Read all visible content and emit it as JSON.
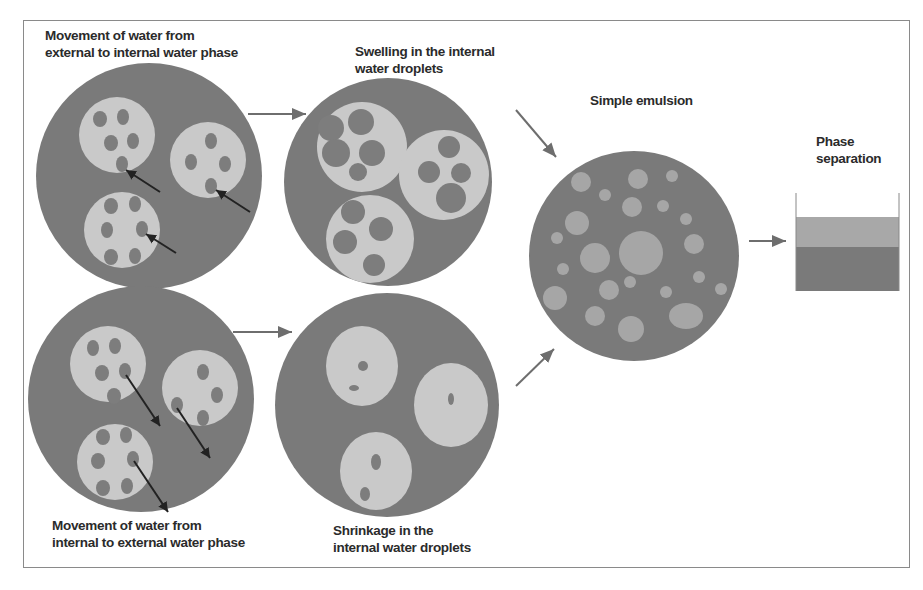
{
  "labels": {
    "top_left": [
      "Movement of water from",
      "external to internal water phase"
    ],
    "top_middle": [
      "Swelling in the internal",
      "water droplets"
    ],
    "bottom_left": [
      "Movement of water from",
      "internal to external water phase"
    ],
    "bottom_middle": [
      "Shrinkage in the",
      "internal water droplets"
    ],
    "simple_emulsion": "Simple emulsion",
    "phase_separation": [
      "Phase",
      "separation"
    ]
  },
  "colors": {
    "oil_phase": "#7a7a7a",
    "water_globule": "#c9c9c9",
    "internal_droplet": "#7d7d7d",
    "arrow": "#6e6e6e",
    "diffusion_arrow": "#222222",
    "upper_layer": "#a8a8a8",
    "lower_layer": "#7a7a7a"
  }
}
